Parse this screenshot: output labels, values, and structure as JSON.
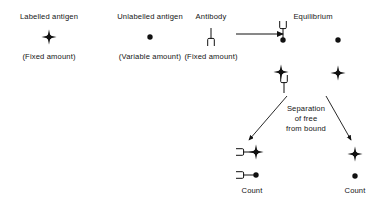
{
  "diagram": {
    "ink_color": "#111111",
    "columns": [
      {
        "id": "labelled-antigen",
        "heading": "Labelled antigen",
        "sublabel": "(Fixed amount)",
        "symbol": "labelled-antigen-star-dot"
      },
      {
        "id": "unlabelled-antigen",
        "heading": "Unlabelled antigen",
        "sublabel": "(Variable amount)",
        "symbol": "unlabelled-antigen-dot"
      },
      {
        "id": "antibody",
        "heading": "Antibody",
        "sublabel": "(Fixed amount)",
        "symbol": "antibody-fork"
      },
      {
        "id": "equilibrium",
        "heading": "Equilibrium",
        "sublabel": "",
        "symbol": "equilibrium-group"
      }
    ],
    "reaction_arrow": {
      "name": "reaction-arrow",
      "direction": "right"
    },
    "separation": {
      "lines": [
        "Separation",
        "of free",
        "from bound"
      ]
    },
    "bound_fraction": {
      "id": "bound-fraction",
      "count_label": "Count",
      "items": [
        "antibody-bound-labelled-antigen",
        "antibody-bound-unlabelled-antigen"
      ]
    },
    "free_fraction": {
      "id": "free-fraction",
      "count_label": "Count",
      "items": [
        "free-labelled-antigen",
        "free-unlabelled-antigen"
      ]
    },
    "equilibrium_items": [
      "antibody-bound-unlabelled-antigen",
      "free-unlabelled-antigen",
      "antibody-bound-labelled-antigen",
      "free-labelled-antigen"
    ],
    "separation_arrows": [
      {
        "name": "separation-arrow-left",
        "from": [
          286,
          97
        ],
        "to": [
          248,
          141
        ]
      },
      {
        "name": "separation-arrow-right",
        "from": [
          327,
          97
        ],
        "to": [
          352,
          141
        ]
      }
    ]
  }
}
